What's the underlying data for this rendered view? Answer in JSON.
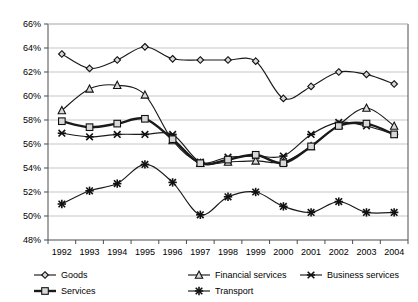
{
  "chart_data": {
    "type": "line",
    "title": "",
    "subtitle": "",
    "xlabel": "",
    "ylabel": "",
    "grid": true,
    "legend_position": "bottom",
    "categories": [
      "1992",
      "1993",
      "1994",
      "1995",
      "1996",
      "1997",
      "1998",
      "1999",
      "2000",
      "2001",
      "2002",
      "2003",
      "2004"
    ],
    "x": [
      1992,
      1993,
      1994,
      1995,
      1996,
      1997,
      1998,
      1999,
      2000,
      2001,
      2002,
      2003,
      2004
    ],
    "ylim": [
      48,
      66
    ],
    "ytick_labels": [
      "66%",
      "64%",
      "62%",
      "60%",
      "58%",
      "56%",
      "54%",
      "52%",
      "50%",
      "48%"
    ],
    "ytick_values": [
      66,
      64,
      62,
      60,
      58,
      56,
      54,
      52,
      50,
      48
    ],
    "y_unit": "%",
    "series": [
      {
        "name": "Goods",
        "marker": "diamond",
        "line_weight": "thin",
        "values": [
          63.5,
          62.3,
          63.0,
          64.1,
          63.1,
          63.0,
          63.0,
          62.9,
          59.8,
          60.8,
          62.0,
          61.8,
          61.0
        ]
      },
      {
        "name": "Financial services",
        "marker": "triangle",
        "line_weight": "thin",
        "values": [
          58.8,
          60.6,
          60.9,
          60.1,
          56.3,
          54.4,
          54.5,
          54.6,
          54.5,
          55.8,
          57.6,
          59.0,
          57.5
        ]
      },
      {
        "name": "Business services",
        "marker": "x",
        "line_weight": "thin",
        "values": [
          56.9,
          56.6,
          56.8,
          56.8,
          56.8,
          54.5,
          54.9,
          55.0,
          55.0,
          56.8,
          57.8,
          57.5,
          56.8
        ]
      },
      {
        "name": "Services",
        "marker": "square",
        "line_weight": "thick",
        "values": [
          57.9,
          57.4,
          57.7,
          58.1,
          56.4,
          54.4,
          54.7,
          55.1,
          54.4,
          55.8,
          57.5,
          57.7,
          56.8
        ]
      },
      {
        "name": "Transport",
        "marker": "star",
        "line_weight": "thin",
        "values": [
          51.0,
          52.1,
          52.7,
          54.3,
          52.8,
          50.1,
          51.6,
          52.0,
          50.8,
          50.3,
          51.2,
          50.3,
          50.3
        ]
      }
    ]
  },
  "legend": {
    "items": [
      {
        "label": "Goods",
        "marker": "diamond"
      },
      {
        "label": "Financial services",
        "marker": "triangle"
      },
      {
        "label": "Business services",
        "marker": "x"
      },
      {
        "label": "Services",
        "marker": "square"
      },
      {
        "label": "Transport",
        "marker": "star"
      }
    ]
  },
  "colors": {
    "line": "#1a1a1a",
    "marker_fill": "#d9d9d9",
    "grid": "#b9b9b9",
    "axis": "#4d4d4d",
    "background": "#ffffff"
  }
}
